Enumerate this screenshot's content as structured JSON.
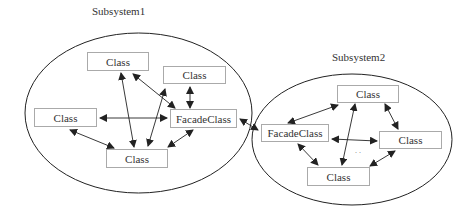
{
  "subsystems": [
    {
      "label": "Subsystem1",
      "classes": [
        {
          "id": "s1-top",
          "label": "Class"
        },
        {
          "id": "s1-right-top",
          "label": "Class"
        },
        {
          "id": "s1-left",
          "label": "Class"
        },
        {
          "id": "s1-facade",
          "label": "FacadeClass"
        },
        {
          "id": "s1-bottom",
          "label": "Class"
        }
      ]
    },
    {
      "label": "Subsystem2",
      "classes": [
        {
          "id": "s2-top",
          "label": "Class"
        },
        {
          "id": "s2-facade",
          "label": "FacadeClass"
        },
        {
          "id": "s2-right",
          "label": "Class"
        },
        {
          "id": "s2-bottom",
          "label": "Class"
        }
      ],
      "ellipsis": ". ."
    }
  ],
  "colors": {
    "line": "#222222",
    "box_border": "#aaaaaa",
    "text": "#333333"
  }
}
